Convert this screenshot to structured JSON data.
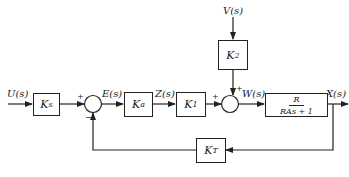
{
  "diagram": {
    "type": "control-system-block-diagram",
    "signals": {
      "input": "U(s)",
      "error": "E(s)",
      "z": "Z(s)",
      "disturbance": "V(s)",
      "w": "W(s)",
      "output": "X(s)"
    },
    "blocks": {
      "ks": {
        "symbol": "K",
        "sub": "s"
      },
      "ka": {
        "symbol": "K",
        "sub": "a"
      },
      "k1": {
        "symbol": "K",
        "sub": "1"
      },
      "k2": {
        "symbol": "K",
        "sub": "2"
      },
      "plant": {
        "numerator": "R",
        "denominator": "RAs + 1"
      },
      "kt": {
        "symbol": "K",
        "sub": "T"
      }
    },
    "junctions": {
      "sum1": {
        "plus": "+",
        "minus": "−"
      },
      "sum2": {
        "plus_left": "+",
        "plus_top": "+"
      }
    },
    "stroke_color": "#222222"
  }
}
